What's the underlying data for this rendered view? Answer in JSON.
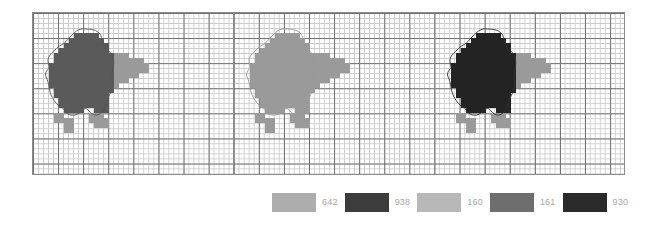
{
  "figure": {
    "title": "",
    "panel_count": 3,
    "grid": {
      "minor_cell_px": 5,
      "major_every": 5,
      "minor_color": "#c9c9c9",
      "major_color": "#6e6e6e",
      "frame_color": "#8c8c8c",
      "background": "#ffffff"
    },
    "panels": [
      {
        "index": 0,
        "name": "panel-left",
        "body_color": "#5a5a5a",
        "appendage_color": "#9a9a9a",
        "contour_color": "#555555"
      },
      {
        "index": 1,
        "name": "panel-middle",
        "body_color": "#9a9a9a",
        "appendage_color": "#9a9a9a",
        "contour_color": "#999999"
      },
      {
        "index": 2,
        "name": "panel-right",
        "body_color": "#232323",
        "appendage_color": "#9a9a9a",
        "contour_color": "#333333"
      }
    ]
  },
  "legend": {
    "position": "bottom-center",
    "entries": [
      {
        "label": "642",
        "color": "#adadad"
      },
      {
        "label": "938",
        "color": "#3c3c3c"
      },
      {
        "label": "160",
        "color": "#b8b8b8"
      },
      {
        "label": "161",
        "color": "#6e6e6e"
      },
      {
        "label": "930",
        "color": "#2a2a2a"
      }
    ],
    "label_color": "#a8a8a8"
  },
  "shape_data": {
    "type": "pixelated-contour",
    "description": "pixelated sheep silhouette with smooth outline contour",
    "cell_px": 5,
    "body_cells": [
      [
        7,
        4
      ],
      [
        8,
        4
      ],
      [
        9,
        4
      ],
      [
        10,
        4
      ],
      [
        11,
        4
      ],
      [
        6,
        5
      ],
      [
        7,
        5
      ],
      [
        8,
        5
      ],
      [
        9,
        5
      ],
      [
        10,
        5
      ],
      [
        11,
        5
      ],
      [
        12,
        5
      ],
      [
        5,
        6
      ],
      [
        6,
        6
      ],
      [
        7,
        6
      ],
      [
        8,
        6
      ],
      [
        9,
        6
      ],
      [
        10,
        6
      ],
      [
        11,
        6
      ],
      [
        12,
        6
      ],
      [
        13,
        6
      ],
      [
        4,
        7
      ],
      [
        5,
        7
      ],
      [
        6,
        7
      ],
      [
        7,
        7
      ],
      [
        8,
        7
      ],
      [
        9,
        7
      ],
      [
        10,
        7
      ],
      [
        11,
        7
      ],
      [
        12,
        7
      ],
      [
        13,
        7
      ],
      [
        3,
        8
      ],
      [
        4,
        8
      ],
      [
        5,
        8
      ],
      [
        6,
        8
      ],
      [
        7,
        8
      ],
      [
        8,
        8
      ],
      [
        9,
        8
      ],
      [
        10,
        8
      ],
      [
        11,
        8
      ],
      [
        12,
        8
      ],
      [
        13,
        8
      ],
      [
        14,
        8
      ],
      [
        3,
        9
      ],
      [
        4,
        9
      ],
      [
        5,
        9
      ],
      [
        6,
        9
      ],
      [
        7,
        9
      ],
      [
        8,
        9
      ],
      [
        9,
        9
      ],
      [
        10,
        9
      ],
      [
        11,
        9
      ],
      [
        12,
        9
      ],
      [
        13,
        9
      ],
      [
        14,
        9
      ],
      [
        2,
        10
      ],
      [
        3,
        10
      ],
      [
        4,
        10
      ],
      [
        5,
        10
      ],
      [
        6,
        10
      ],
      [
        7,
        10
      ],
      [
        8,
        10
      ],
      [
        9,
        10
      ],
      [
        10,
        10
      ],
      [
        11,
        10
      ],
      [
        12,
        10
      ],
      [
        13,
        10
      ],
      [
        14,
        10
      ],
      [
        2,
        11
      ],
      [
        3,
        11
      ],
      [
        4,
        11
      ],
      [
        5,
        11
      ],
      [
        6,
        11
      ],
      [
        7,
        11
      ],
      [
        8,
        11
      ],
      [
        9,
        11
      ],
      [
        10,
        11
      ],
      [
        11,
        11
      ],
      [
        12,
        11
      ],
      [
        13,
        11
      ],
      [
        14,
        11
      ],
      [
        2,
        12
      ],
      [
        3,
        12
      ],
      [
        4,
        12
      ],
      [
        5,
        12
      ],
      [
        6,
        12
      ],
      [
        7,
        12
      ],
      [
        8,
        12
      ],
      [
        9,
        12
      ],
      [
        10,
        12
      ],
      [
        11,
        12
      ],
      [
        12,
        12
      ],
      [
        13,
        12
      ],
      [
        14,
        12
      ],
      [
        2,
        13
      ],
      [
        3,
        13
      ],
      [
        4,
        13
      ],
      [
        5,
        13
      ],
      [
        6,
        13
      ],
      [
        7,
        13
      ],
      [
        8,
        13
      ],
      [
        9,
        13
      ],
      [
        10,
        13
      ],
      [
        11,
        13
      ],
      [
        12,
        13
      ],
      [
        13,
        13
      ],
      [
        14,
        13
      ],
      [
        2,
        14
      ],
      [
        3,
        14
      ],
      [
        4,
        14
      ],
      [
        5,
        14
      ],
      [
        6,
        14
      ],
      [
        7,
        14
      ],
      [
        8,
        14
      ],
      [
        9,
        14
      ],
      [
        10,
        14
      ],
      [
        11,
        14
      ],
      [
        12,
        14
      ],
      [
        13,
        14
      ],
      [
        14,
        14
      ],
      [
        3,
        15
      ],
      [
        4,
        15
      ],
      [
        5,
        15
      ],
      [
        6,
        15
      ],
      [
        7,
        15
      ],
      [
        8,
        15
      ],
      [
        9,
        15
      ],
      [
        10,
        15
      ],
      [
        11,
        15
      ],
      [
        12,
        15
      ],
      [
        13,
        15
      ],
      [
        14,
        15
      ],
      [
        3,
        16
      ],
      [
        4,
        16
      ],
      [
        5,
        16
      ],
      [
        6,
        16
      ],
      [
        7,
        16
      ],
      [
        8,
        16
      ],
      [
        9,
        16
      ],
      [
        10,
        16
      ],
      [
        11,
        16
      ],
      [
        12,
        16
      ],
      [
        13,
        16
      ],
      [
        4,
        17
      ],
      [
        5,
        17
      ],
      [
        6,
        17
      ],
      [
        7,
        17
      ],
      [
        8,
        17
      ],
      [
        9,
        17
      ],
      [
        10,
        17
      ],
      [
        11,
        17
      ],
      [
        12,
        17
      ],
      [
        13,
        17
      ],
      [
        4,
        18
      ],
      [
        5,
        18
      ],
      [
        6,
        18
      ],
      [
        7,
        18
      ],
      [
        8,
        18
      ],
      [
        9,
        18
      ],
      [
        10,
        18
      ],
      [
        11,
        18
      ],
      [
        12,
        18
      ],
      [
        13,
        18
      ],
      [
        5,
        19
      ],
      [
        6,
        19
      ],
      [
        7,
        19
      ],
      [
        8,
        19
      ],
      [
        11,
        19
      ],
      [
        12,
        19
      ],
      [
        13,
        19
      ]
    ],
    "head_cells": [
      [
        15,
        8
      ],
      [
        16,
        8
      ],
      [
        17,
        8
      ],
      [
        15,
        9
      ],
      [
        16,
        9
      ],
      [
        17,
        9
      ],
      [
        18,
        9
      ],
      [
        19,
        9
      ],
      [
        20,
        9
      ],
      [
        15,
        10
      ],
      [
        16,
        10
      ],
      [
        17,
        10
      ],
      [
        18,
        10
      ],
      [
        19,
        10
      ],
      [
        20,
        10
      ],
      [
        21,
        10
      ],
      [
        15,
        11
      ],
      [
        16,
        11
      ],
      [
        17,
        11
      ],
      [
        18,
        11
      ],
      [
        19,
        11
      ],
      [
        20,
        11
      ],
      [
        21,
        11
      ],
      [
        15,
        12
      ],
      [
        16,
        12
      ],
      [
        17,
        12
      ],
      [
        18,
        12
      ],
      [
        19,
        12
      ],
      [
        15,
        13
      ],
      [
        16,
        13
      ],
      [
        17,
        13
      ],
      [
        15,
        14
      ]
    ],
    "leg_cells": [
      [
        3,
        20
      ],
      [
        4,
        20
      ],
      [
        3,
        21
      ],
      [
        4,
        21
      ],
      [
        5,
        21
      ],
      [
        6,
        21
      ],
      [
        5,
        22
      ],
      [
        6,
        22
      ],
      [
        5,
        23
      ],
      [
        6,
        23
      ],
      [
        10,
        20
      ],
      [
        11,
        20
      ],
      [
        12,
        20
      ],
      [
        10,
        21
      ],
      [
        11,
        21
      ],
      [
        12,
        21
      ],
      [
        13,
        21
      ],
      [
        11,
        22
      ],
      [
        12,
        22
      ],
      [
        13,
        22
      ]
    ]
  }
}
